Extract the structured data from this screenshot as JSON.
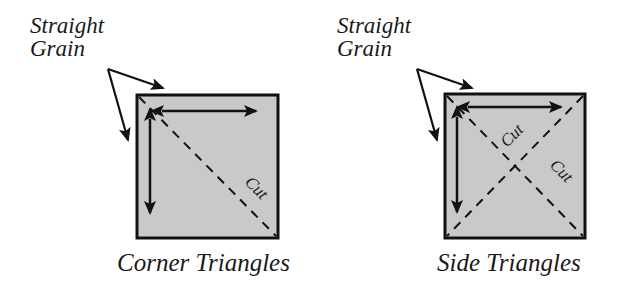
{
  "colors": {
    "fabric_fill": "#c9c9c9",
    "stroke": "#111111",
    "background": "#ffffff"
  },
  "diagrams": [
    {
      "id": "corner",
      "grain_label_line1": "Straight",
      "grain_label_line2": "Grain",
      "cut_labels": [
        "Cut"
      ],
      "caption": "Corner Triangles"
    },
    {
      "id": "side",
      "grain_label_line1": "Straight",
      "grain_label_line2": "Grain",
      "cut_labels": [
        "Cut",
        "Cut"
      ],
      "caption": "Side Triangles"
    }
  ]
}
